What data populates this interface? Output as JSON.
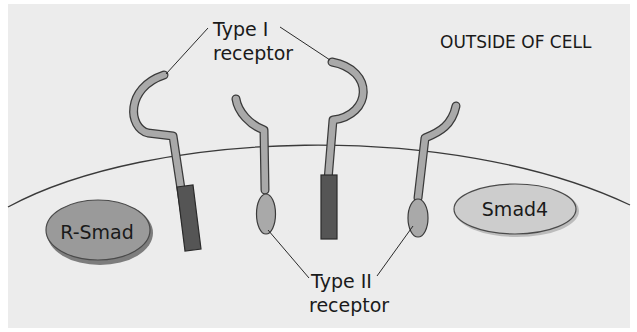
{
  "labels": {
    "type1_line1": "Type I",
    "type1_line2": "receptor",
    "type2_line1": "Type II",
    "type2_line2": "receptor",
    "outside": "OUTSIDE OF CELL",
    "rsmad": "R-Smad",
    "smad4": "Smad4"
  },
  "colors": {
    "background": "#ececec",
    "receptor_fill": "#a9a9a9",
    "kinase_dark": "#555555",
    "rsmad_fill": "#9a9a9a",
    "smad4_fill": "#cdcdcd",
    "outline": "#3a3a3a"
  }
}
